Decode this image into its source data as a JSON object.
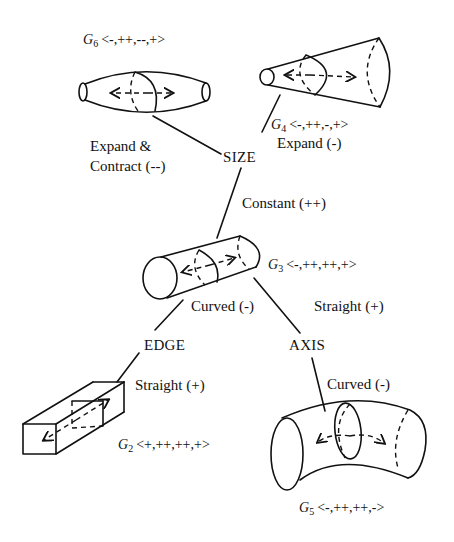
{
  "diagram": {
    "type": "tree",
    "nodes": {
      "size": "SIZE",
      "edge": "EDGE",
      "axis": "AXIS"
    },
    "edges": {
      "expand_contract": "Expand &",
      "expand_contract_2": "Contract (--)",
      "expand": "Expand (-)",
      "constant": "Constant (++)",
      "curved_edge": "Curved (-)",
      "straight_axis": "Straight (+)",
      "straight_edge": "Straight (+)",
      "curved_axis": "Curved (-)"
    },
    "geons": [
      {
        "id": "G6",
        "name": "G",
        "sub": "6",
        "code": "<-,++,--,+>",
        "shape": "expand-and-contract cylinder"
      },
      {
        "id": "G4",
        "name": "G",
        "sub": "4",
        "code": "<-,++,-,+>",
        "shape": "cone"
      },
      {
        "id": "G3",
        "name": "G",
        "sub": "3",
        "code": "<-,++,++,+>",
        "shape": "cylinder"
      },
      {
        "id": "G2",
        "name": "G",
        "sub": "2",
        "code": "<+,++,++,+>",
        "shape": "brick"
      },
      {
        "id": "G5",
        "name": "G",
        "sub": "5",
        "code": "<-,++,++,->",
        "shape": "curved cylinder"
      }
    ]
  }
}
